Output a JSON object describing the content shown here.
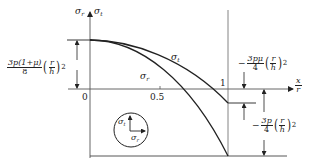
{
  "figure": {
    "axes": {
      "y_labels": [
        "σr",
        "σt"
      ],
      "x_label_numerator": "x",
      "x_label_denominator": "r",
      "origin_label": "0",
      "x_ticks": [
        "0.5",
        "1"
      ]
    },
    "curves": {
      "sigma_t_label": "σt",
      "sigma_r_label": "σr"
    },
    "annotations": {
      "center_value": {
        "numerator": "3p(1+μ)",
        "denominator": "8",
        "paren_num": "r",
        "paren_den": "h",
        "exponent": "2"
      },
      "edge_sigma_t": {
        "sign": "−",
        "numerator": "3pμ",
        "denominator": "4",
        "paren_num": "r",
        "paren_den": "h",
        "exponent": "2"
      },
      "edge_sigma_r": {
        "sign": "−",
        "numerator": "3p",
        "denominator": "4",
        "paren_num": "r",
        "paren_den": "h",
        "exponent": "2"
      }
    },
    "inset": {
      "sigma_t": "σt",
      "sigma_r": "σr"
    },
    "colors": {
      "line": "#222222",
      "axis": "#555555",
      "background": "#ffffff"
    }
  }
}
